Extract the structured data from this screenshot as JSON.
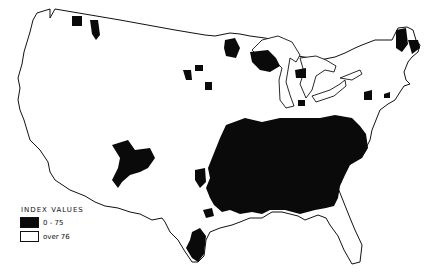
{
  "map": {
    "region": "Contiguous United States",
    "colors": {
      "low_index": "#0a0a0a",
      "high_index": "#ffffff",
      "outline": "#111111"
    }
  },
  "legend": {
    "title": "INDEX VALUES",
    "items": [
      {
        "label": "0 - 75",
        "swatch": "black"
      },
      {
        "label": "over 76",
        "swatch": "white"
      }
    ]
  }
}
